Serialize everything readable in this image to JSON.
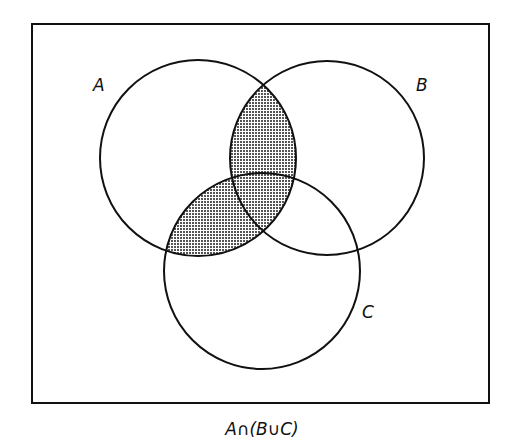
{
  "diagram": {
    "type": "venn",
    "caption": "A∩(B∪C)",
    "shaded_region": "A∩(B∪C)",
    "universe": {
      "x": 32,
      "y": 24,
      "width": 457,
      "height": 379
    },
    "sets": [
      {
        "id": "A",
        "label": "A",
        "cx": 198,
        "cy": 158,
        "r": 98,
        "label_x": 93,
        "label_y": 91
      },
      {
        "id": "B",
        "label": "B",
        "cx": 327,
        "cy": 158,
        "r": 97,
        "label_x": 416,
        "label_y": 91
      },
      {
        "id": "C",
        "label": "C",
        "cx": 262,
        "cy": 271,
        "r": 98,
        "label_x": 362,
        "label_y": 318
      }
    ],
    "colors": {
      "stroke": "#111111",
      "fill_pattern": "#444444",
      "background": "#ffffff"
    }
  }
}
